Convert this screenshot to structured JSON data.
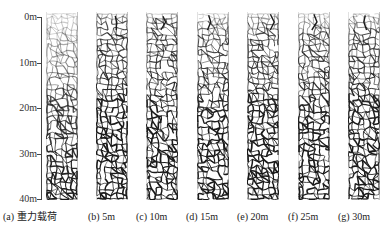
{
  "figure": {
    "axis": {
      "ticks": [
        {
          "label": "0m",
          "y": 17
        },
        {
          "label": "10m",
          "y": 63
        },
        {
          "label": "20m",
          "y": 108
        },
        {
          "label": "30m",
          "y": 154
        },
        {
          "label": "40m",
          "y": 200
        }
      ]
    },
    "panels": [
      {
        "id": "a",
        "caption": "(a) 重力载荷",
        "x": 46,
        "fade_top": 0.45,
        "surface_crack": false
      },
      {
        "id": "b",
        "caption": "(b) 5m",
        "x": 96,
        "fade_top": 0.05,
        "surface_crack": true
      },
      {
        "id": "c",
        "caption": "(c) 10m",
        "x": 146,
        "fade_top": 0.05,
        "surface_crack": true
      },
      {
        "id": "d",
        "caption": "(d) 15m",
        "x": 197,
        "fade_top": 0.12,
        "surface_crack": true
      },
      {
        "id": "e",
        "caption": "(e) 20m",
        "x": 247,
        "fade_top": 0.08,
        "surface_crack": true
      },
      {
        "id": "f",
        "caption": "(f) 25m",
        "x": 298,
        "fade_top": 0.12,
        "surface_crack": true
      },
      {
        "id": "g",
        "caption": "(g) 30m",
        "x": 348,
        "fade_top": 0.1,
        "surface_crack": true
      }
    ],
    "colors": {
      "crack": "#1a1a1a",
      "background": "#ffffff",
      "border": "#9a9a9a"
    }
  }
}
